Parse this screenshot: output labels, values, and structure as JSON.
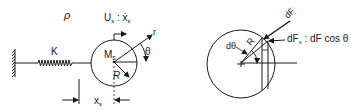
{
  "left_panel": {
    "density_label": "ρ",
    "spring_label": "K",
    "mass_label": "M",
    "mass_sub": "s",
    "velocity_label_main": "U",
    "velocity_sub": "s",
    "velocity_eq": " : ẋ",
    "velocity_eq_sub": "s",
    "radial_label": "r",
    "angle_label": "θ",
    "radius_label": "R",
    "displacement_label": "x",
    "displacement_sub": "s"
  },
  "right_panel": {
    "force_label": "dF",
    "radius_label": "R",
    "dtheta_label": "dθ",
    "component_label_main": "dF",
    "component_sub": "x",
    "component_eq": " : dF cos θ"
  },
  "colors": {
    "stroke": "#1a1a1a",
    "background": "#ffffff"
  }
}
